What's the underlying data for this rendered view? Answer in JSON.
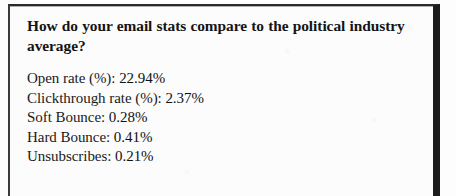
{
  "document": {
    "type": "scanned-callout-box",
    "heading": "How do your email stats compare to the political industry average?",
    "colors": {
      "page_background": "#fdfdfd",
      "box_background": "#fcfcfc",
      "border": "#2b2b2b",
      "border_heavy_right": "#1c1c1c",
      "text": "#141414"
    },
    "stats": [
      {
        "label": "Open rate (%):",
        "value": "22.94%",
        "line": "Open rate (%): 22.94%"
      },
      {
        "label": "Clickthrough rate (%):",
        "value": "2.37%",
        "line": "Clickthrough rate (%): 2.37%"
      },
      {
        "label": "Soft Bounce:",
        "value": "0.28%",
        "line": "Soft Bounce: 0.28%"
      },
      {
        "label": "Hard Bounce:",
        "value": "0.41%",
        "line": "Hard Bounce: 0.41%"
      },
      {
        "label": "Unsubscribes:",
        "value": "0.21%",
        "line": "Unsubscribes: 0.21%"
      }
    ]
  }
}
